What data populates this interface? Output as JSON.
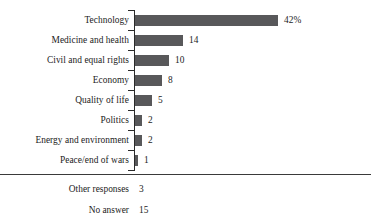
{
  "chart_data": {
    "type": "bar",
    "orientation": "horizontal",
    "title": "",
    "subtitle": "",
    "xlabel": "",
    "ylabel": "",
    "grid": false,
    "legend": null,
    "axis": {
      "category_axis": "vertical-left",
      "ticks_shown": true,
      "value_axis_labels_shown": false,
      "xlim": [
        0,
        42
      ]
    },
    "categories": [
      "Technology",
      "Medicine and health",
      "Civil and equal rights",
      "Economy",
      "Quality of life",
      "Politics",
      "Energy and environment",
      "Peace/end of wars"
    ],
    "values": [
      42,
      14,
      10,
      8,
      5,
      2,
      2,
      1
    ],
    "value_labels": [
      "42%",
      "14",
      "10",
      "8",
      "5",
      "2",
      "2",
      "1"
    ],
    "bar_color": "#58585a",
    "bars": [
      {
        "label": "Technology",
        "value": 42,
        "display": "42%"
      },
      {
        "label": "Medicine and health",
        "value": 14,
        "display": "14"
      },
      {
        "label": "Civil and equal rights",
        "value": 10,
        "display": "10"
      },
      {
        "label": "Economy",
        "value": 8,
        "display": "8"
      },
      {
        "label": "Quality of life",
        "value": 5,
        "display": "5"
      },
      {
        "label": "Politics",
        "value": 2,
        "display": "2"
      },
      {
        "label": "Energy and environment",
        "value": 2,
        "display": "2"
      },
      {
        "label": "Peace/end of wars",
        "value": 1,
        "display": "1"
      }
    ],
    "footnote_rows": [
      {
        "label": "Other responses",
        "value": 3,
        "display": "3"
      },
      {
        "label": "No answer",
        "value": 15,
        "display": "15"
      }
    ],
    "annotations": []
  },
  "style": {
    "background": "#ffffff",
    "text_color": "#1c1c1c",
    "axis_color": "#2b2b2b",
    "divider_color": "#3a3a3a"
  }
}
